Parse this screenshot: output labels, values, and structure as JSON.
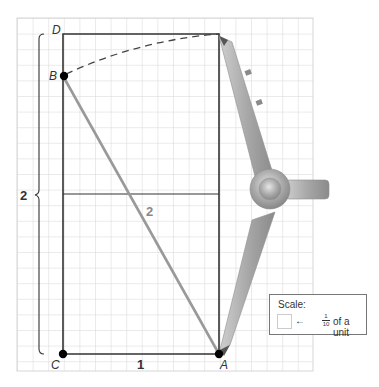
{
  "diagram": {
    "points": {
      "D": "D",
      "B": "B",
      "C": "C",
      "A": "A"
    },
    "labels": {
      "height_brace": "2",
      "hypotenuse": "2",
      "base": "1"
    },
    "scale": {
      "title": "Scale:",
      "fraction_num": "1",
      "fraction_den": "10",
      "text": "of a unit",
      "arrow": "←"
    },
    "colors": {
      "grid": "#d4d4d4",
      "frame": "#333333",
      "segment_ab": "#999999",
      "compass": "#a9a9a9"
    }
  }
}
